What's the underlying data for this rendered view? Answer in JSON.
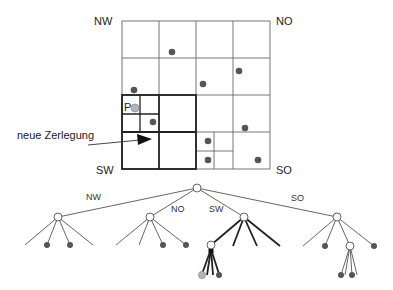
{
  "labels": {
    "nw": "NW",
    "no": "NO",
    "sw": "SW",
    "so": "SO",
    "point_p": "P",
    "annotation": "neue Zerlegung"
  },
  "tree_labels": {
    "nw": "NW",
    "no": "NO",
    "sw": "SW",
    "so": "SO"
  },
  "colors": {
    "line": "#555555",
    "thick_line": "#222222",
    "point": "#555555",
    "query_point": "#b5b5b5"
  },
  "grid": {
    "origin": [
      122,
      21
    ],
    "cell_size": 37,
    "cols": 4,
    "rows": 4
  },
  "points": [
    {
      "x": 172,
      "y": 52
    },
    {
      "x": 134,
      "y": 90
    },
    {
      "x": 203,
      "y": 84
    },
    {
      "x": 239,
      "y": 71
    },
    {
      "x": 153,
      "y": 122
    },
    {
      "x": 245,
      "y": 128
    },
    {
      "x": 208,
      "y": 141
    },
    {
      "x": 208,
      "y": 160
    },
    {
      "x": 258,
      "y": 160
    }
  ],
  "query_point": {
    "x": 135,
    "y": 108,
    "label": "P"
  }
}
